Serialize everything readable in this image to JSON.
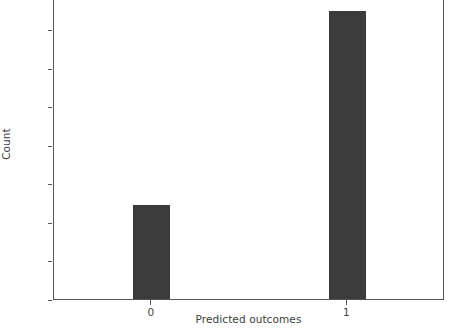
{
  "chart_data": {
    "type": "bar",
    "title": "",
    "subtitle": "",
    "xlabel": "Predicted outcomes",
    "ylabel": "Count",
    "categories": [
      "0",
      "1"
    ],
    "values": [
      4900,
      15000
    ],
    "series": [
      {
        "name": "Count",
        "values": [
          4900,
          15000
        ]
      }
    ],
    "ylim": [
      0,
      15600
    ],
    "xlim": [
      -0.5,
      1.5
    ],
    "yticks": [
      0,
      2000,
      4000,
      6000,
      8000,
      10000,
      12000,
      14000
    ],
    "ytick_labels": [
      "0",
      "2000",
      "4000",
      "6000",
      "8000",
      "10000",
      "12000",
      "14000"
    ],
    "xticks": [
      0,
      1
    ],
    "xtick_labels": [
      "0",
      "1"
    ],
    "grid": false,
    "legend": null,
    "legend_position": "none",
    "bar_color": "#3b3b3b",
    "axis_color": "#555555",
    "text_color": "#464646",
    "background_color": "#ffffff",
    "annotations": []
  },
  "axes": {
    "y_axis_label": "Count",
    "x_axis_label": "Predicted outcomes"
  }
}
